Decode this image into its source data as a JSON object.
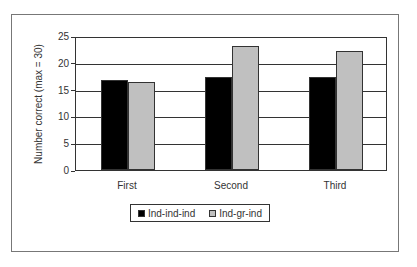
{
  "chart_data": {
    "type": "bar",
    "title": "",
    "xlabel": "",
    "ylabel": "Number correct (max = 30)",
    "ylim": [
      0,
      25
    ],
    "yticks": [
      0,
      5,
      10,
      15,
      20,
      25
    ],
    "grid": true,
    "legend_position": "bottom",
    "categories": [
      "First",
      "Second",
      "Third"
    ],
    "series": [
      {
        "name": "Ind-ind-ind",
        "color": "#000000",
        "values": [
          16.8,
          17.3,
          17.3
        ]
      },
      {
        "name": "Ind-gr-ind",
        "color": "#c0c0c0",
        "values": [
          16.4,
          23.1,
          22.2
        ]
      }
    ]
  }
}
